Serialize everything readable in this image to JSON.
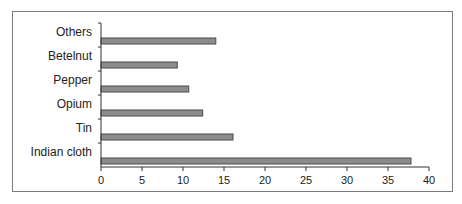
{
  "chart_data": {
    "type": "bar",
    "orientation": "horizontal",
    "title": "",
    "xlabel": "",
    "ylabel": "",
    "categories": [
      "Indian cloth",
      "Tin",
      "Opium",
      "Pepper",
      "Betelnut",
      "Others"
    ],
    "values": [
      37.8,
      16.1,
      12.4,
      10.7,
      9.3,
      14.0
    ],
    "xlim": [
      0,
      40
    ],
    "xticks": [
      0,
      5,
      10,
      15,
      20,
      25,
      30,
      35,
      40
    ],
    "grid": false,
    "legend": null,
    "bar_color": "#8c8c8c",
    "bar_edge_color": "#4a4a4a"
  }
}
